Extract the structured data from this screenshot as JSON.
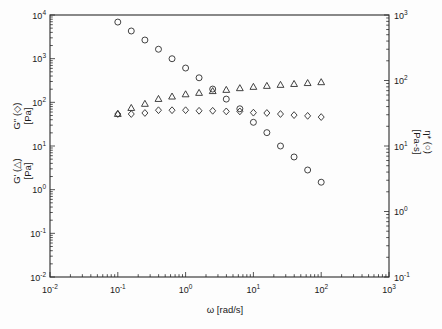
{
  "figure": {
    "background": "#fdfdfd",
    "frame_color": "#2a2a2a",
    "marker_color": "#2e2e2e",
    "text_color": "#1a1a1a"
  },
  "chart_data": {
    "type": "scatter",
    "title": "",
    "grid": false,
    "legend_position": "none",
    "axes": {
      "x": {
        "title": "ω [rad/s]",
        "scale": "log",
        "min_exp": -2,
        "max_exp": 3,
        "tick_exponents": [
          -2,
          -1,
          0,
          1,
          2,
          3
        ],
        "tick_labels": [
          "10⁻²",
          "10⁻¹",
          "10⁰",
          "10¹",
          "10²",
          "10³"
        ]
      },
      "left": {
        "scale": "log",
        "min_exp": -2,
        "max_exp": 4,
        "tick_exponents": [
          4,
          3,
          2,
          1,
          0,
          -1,
          -2
        ],
        "tick_labels": [
          "10⁴",
          "10³",
          "10²",
          "10¹",
          "10⁰",
          "10⁻¹",
          "10⁻²"
        ],
        "titles": [
          {
            "line1": "G\" (◇)",
            "line2": "[Pa]"
          },
          {
            "line1": "G' (△)",
            "line2": "[Pa]"
          }
        ]
      },
      "right": {
        "scale": "log",
        "min_exp": -1,
        "max_exp": 3,
        "tick_exponents": [
          3,
          2,
          1,
          0,
          -1
        ],
        "tick_labels": [
          "10³",
          "10²",
          "10¹",
          "10⁰",
          "10⁻¹"
        ],
        "title": {
          "line1": "η* (○)",
          "line2": "[Pa-s]"
        }
      }
    },
    "series": [
      {
        "name": "storage-modulus",
        "label": "G' (△)",
        "marker": "triangle",
        "axis": "left",
        "x": [
          0.1,
          0.158,
          0.251,
          0.398,
          0.631,
          1.0,
          1.58,
          2.51,
          3.98,
          6.31,
          10,
          15.8,
          25.1,
          39.8,
          63.1,
          100
        ],
        "y": [
          54,
          74,
          92,
          119,
          135,
          152,
          164,
          180,
          192,
          210,
          225,
          237,
          250,
          262,
          275,
          288
        ]
      },
      {
        "name": "loss-modulus",
        "label": "G\" (◇)",
        "marker": "diamond",
        "axis": "left",
        "x": [
          0.1,
          0.158,
          0.251,
          0.398,
          0.631,
          1.0,
          1.58,
          2.51,
          3.98,
          6.31,
          10,
          15.8,
          25.1,
          39.8,
          63.1,
          100
        ],
        "y": [
          54,
          54,
          57,
          66,
          66,
          66,
          64,
          64,
          62,
          62,
          58,
          57,
          54,
          51,
          49,
          46
        ]
      },
      {
        "name": "complex-viscosity",
        "label": "η* (○)",
        "marker": "circle",
        "axis": "right",
        "x": [
          0.1,
          0.158,
          0.251,
          0.398,
          0.631,
          1.0,
          1.58,
          2.51,
          3.98,
          6.31,
          10,
          15.8,
          25.1,
          39.8,
          63.1,
          100
        ],
        "y": [
          780,
          570,
          415,
          300,
          215,
          155,
          110,
          74,
          52,
          37,
          23,
          16,
          10,
          6.8,
          4.3,
          2.8
        ]
      }
    ]
  }
}
